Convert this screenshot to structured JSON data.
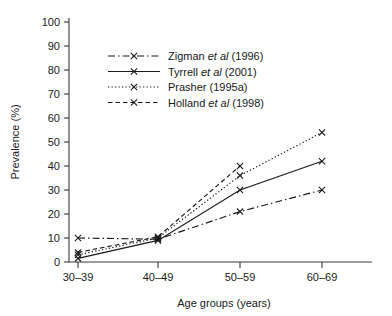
{
  "chart_data": {
    "type": "line",
    "title": "",
    "xlabel": "Age groups (years)",
    "ylabel": "Prevalence (%)",
    "categories": [
      "30–39",
      "40–49",
      "50–59",
      "60–69"
    ],
    "ylim": [
      0,
      100
    ],
    "ytick_values": [
      0,
      10,
      20,
      30,
      40,
      50,
      60,
      70,
      80,
      90,
      100
    ],
    "ytick_labels": [
      "0",
      "10",
      "20",
      "30",
      "40",
      "50",
      "60",
      "70",
      "80",
      "90",
      "100"
    ],
    "grid": false,
    "legend_position": "upper-left-inside",
    "marker": "x",
    "series": [
      {
        "name": "Zigman et al (1996)",
        "name_prefix": "Zigman",
        "name_italic": "et al",
        "name_suffix": "(1996)",
        "linestyle": "dashdot",
        "dasharray": "7,3,1.5,3",
        "color": "#1a1a1a",
        "values": [
          10,
          9.5,
          21,
          30
        ]
      },
      {
        "name": "Tyrrell et al (2001)",
        "name_prefix": "Tyrrell",
        "name_italic": "et al",
        "name_suffix": "(2001)",
        "linestyle": "solid",
        "dasharray": "",
        "color": "#1a1a1a",
        "values": [
          1.5,
          9,
          30,
          42
        ]
      },
      {
        "name": "Prasher (1995a)",
        "name_prefix": "Prasher",
        "name_italic": "",
        "name_suffix": "(1995a)",
        "linestyle": "dotted",
        "dasharray": "1.3,2.2",
        "color": "#1a1a1a",
        "values": [
          3,
          10,
          36,
          54
        ]
      },
      {
        "name": "Holland et al (1998)",
        "name_prefix": "Holland",
        "name_italic": "et al",
        "name_suffix": "(1998)",
        "linestyle": "dashed",
        "dasharray": "4.5,3",
        "color": "#1a1a1a",
        "values": [
          4,
          10.5,
          40,
          null
        ]
      }
    ]
  }
}
